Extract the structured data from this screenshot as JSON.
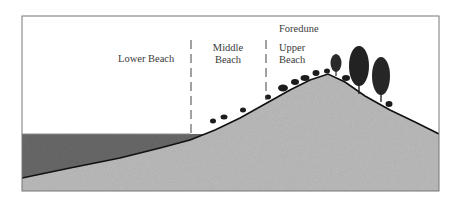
{
  "diagram": {
    "type": "beach-profile-cross-section",
    "labels": {
      "lower_beach": "Lower Beach",
      "middle_beach_line1": "Middle",
      "middle_beach_line2": "Beach",
      "foredune": "Foredune",
      "upper_beach_line1": "Upper",
      "upper_beach_line2": "Beach"
    },
    "zones": [
      "Lower Beach",
      "Middle Beach",
      "Upper Beach",
      "Foredune"
    ],
    "colors": {
      "frame": "#777777",
      "water": "#6b6b6b",
      "sand": "#bdbdbd",
      "ground_line": "#111111",
      "vegetation": "#1c1c1c",
      "text": "#3a3a3a",
      "background": "#ffffff"
    }
  }
}
